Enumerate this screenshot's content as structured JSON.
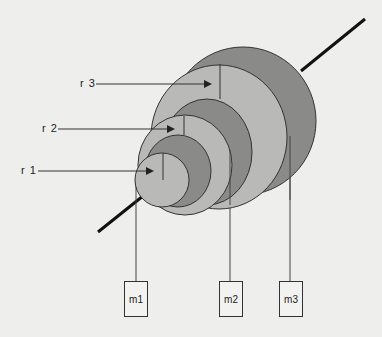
{
  "diagram": {
    "type": "concentric-ring-stack on shaft",
    "radius_labels": [
      {
        "id": "r1",
        "label": "r 1"
      },
      {
        "id": "r2",
        "label": "r 2"
      },
      {
        "id": "r3",
        "label": "r 3"
      }
    ],
    "masses": [
      {
        "id": "m1",
        "label": "m1"
      },
      {
        "id": "m2",
        "label": "m2"
      },
      {
        "id": "m3",
        "label": "m3"
      }
    ],
    "colors": {
      "background": "#eeeeec",
      "light_fill": "#b9b9b7",
      "dark_fill": "#8a8a88",
      "stroke": "#333333",
      "shaft": "#111111"
    }
  }
}
